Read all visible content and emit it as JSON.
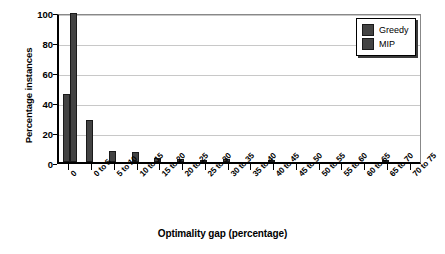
{
  "chart_data": {
    "type": "bar",
    "title": "",
    "xlabel": "Optimality gap (percentage)",
    "ylabel": "Percentage instances",
    "ylim": [
      0,
      100
    ],
    "yticks": [
      0,
      20,
      40,
      60,
      80,
      100
    ],
    "grid": true,
    "legend_position": "top-right",
    "bar_color": "#434343",
    "categories": [
      "0",
      "0 to 5",
      "5 to 10",
      "10 to 15",
      "15 to 20",
      "20 to 25",
      "25 to 30",
      "30 to 35",
      "35 to 40",
      "40 to 45",
      "45 to 50",
      "50 to 55",
      "55 to 60",
      "60 to 65",
      "65 to 70",
      "70 to 75"
    ],
    "series": [
      {
        "name": "Greedy",
        "color": "#434343",
        "values": [
          45.5,
          28,
          7.5,
          6.5,
          2.5,
          2,
          0.8,
          1.8,
          0,
          1.2,
          0,
          0,
          0,
          0,
          0.7,
          0
        ]
      },
      {
        "name": "MIP",
        "color": "#434343",
        "values": [
          99.5,
          0,
          0,
          0,
          0,
          0,
          0,
          0,
          0,
          0,
          0,
          0,
          0,
          0,
          0,
          0
        ]
      }
    ]
  },
  "legend": {
    "items": [
      {
        "label": "Greedy"
      },
      {
        "label": "MIP"
      }
    ]
  }
}
